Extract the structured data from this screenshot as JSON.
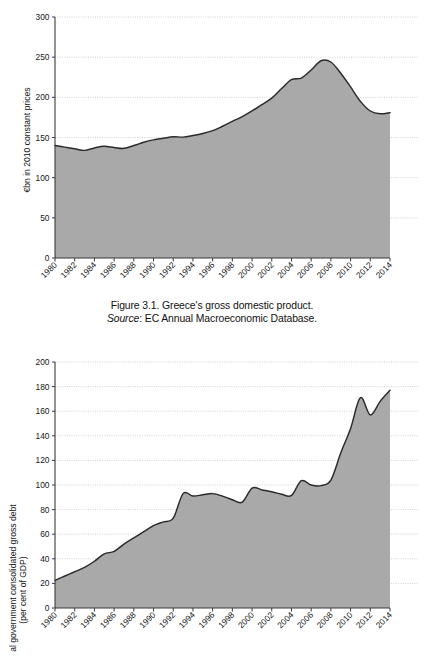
{
  "document": {
    "page_background": "#ffffff",
    "figures": [
      {
        "id": "figure-3-1",
        "caption_line_1": "Figure 3.1. Greece's gross domestic product.",
        "caption_source_label": "Source",
        "caption_source_text": ": EC Annual Macroeconomic Database."
      }
    ]
  },
  "chart_data": [
    {
      "id": "chart-gdp",
      "type": "area",
      "title": "",
      "xlabel": "",
      "ylabel": "€bn in 2010 constant prices",
      "ylim": [
        0,
        300
      ],
      "xlim": [
        1980,
        2014
      ],
      "grid": true,
      "legend": "none",
      "accent_fill": "#a9a9a9",
      "line_color": "#2a2a2a",
      "ytick_labels": [
        "0",
        "50",
        "100",
        "150",
        "200",
        "250",
        "300"
      ],
      "yticks": [
        0,
        50,
        100,
        150,
        200,
        250,
        300
      ],
      "xtick_labels": [
        "1980",
        "1982",
        "1984",
        "1986",
        "1988",
        "1990",
        "1992",
        "1994",
        "1996",
        "1998",
        "2000",
        "2002",
        "2004",
        "2006",
        "2008",
        "2010",
        "2012",
        "2014"
      ],
      "xticks": [
        1980,
        1982,
        1984,
        1986,
        1988,
        1990,
        1992,
        1994,
        1996,
        1998,
        2000,
        2002,
        2004,
        2006,
        2008,
        2010,
        2012,
        2014
      ],
      "x": [
        1980,
        1981,
        1982,
        1983,
        1984,
        1985,
        1986,
        1987,
        1988,
        1989,
        1990,
        1991,
        1992,
        1993,
        1994,
        1995,
        1996,
        1997,
        1998,
        1999,
        2000,
        2001,
        2002,
        2003,
        2004,
        2005,
        2006,
        2007,
        2008,
        2009,
        2010,
        2011,
        2012,
        2013,
        2014
      ],
      "values": [
        140,
        138,
        136,
        134,
        137,
        139,
        137.5,
        136.5,
        140,
        144,
        147,
        149,
        151,
        150.5,
        152.5,
        155,
        158.5,
        164,
        170,
        176,
        183,
        191,
        199,
        211,
        222,
        224,
        234,
        245.5,
        244,
        230,
        213,
        195,
        183,
        179.5,
        181
      ]
    },
    {
      "id": "chart-debt",
      "type": "area",
      "title": "",
      "xlabel": "",
      "ylabel_line_1": "General government consolidated gross debt",
      "ylabel_line_2": "(per cent of GDP)",
      "ylim": [
        0,
        200
      ],
      "xlim": [
        1980,
        2014
      ],
      "grid": true,
      "legend": "none",
      "accent_fill": "#a9a9a9",
      "line_color": "#2a2a2a",
      "ytick_labels": [
        "0",
        "20",
        "40",
        "60",
        "80",
        "100",
        "120",
        "140",
        "160",
        "180",
        "200"
      ],
      "yticks": [
        0,
        20,
        40,
        60,
        80,
        100,
        120,
        140,
        160,
        180,
        200
      ],
      "xtick_labels": [
        "1980",
        "1982",
        "1984",
        "1986",
        "1988",
        "1990",
        "1992",
        "1994",
        "1996",
        "1998",
        "2000",
        "2002",
        "2004",
        "2006",
        "2008",
        "2010",
        "2012",
        "2014"
      ],
      "xticks": [
        1980,
        1982,
        1984,
        1986,
        1988,
        1990,
        1992,
        1994,
        1996,
        1998,
        2000,
        2002,
        2004,
        2006,
        2008,
        2010,
        2012,
        2014
      ],
      "x": [
        1980,
        1981,
        1982,
        1983,
        1984,
        1985,
        1986,
        1987,
        1988,
        1989,
        1990,
        1991,
        1992,
        1993,
        1994,
        1995,
        1996,
        1997,
        1998,
        1999,
        2000,
        2001,
        2002,
        2003,
        2004,
        2005,
        2006,
        2007,
        2008,
        2009,
        2010,
        2011,
        2012,
        2013,
        2014
      ],
      "values": [
        22.5,
        26,
        29.5,
        33,
        38,
        44,
        46,
        52,
        57,
        62,
        67,
        70,
        73,
        93,
        91,
        92,
        93,
        91,
        88,
        86,
        97.5,
        96,
        94.5,
        92.5,
        91.5,
        103.5,
        100,
        99.5,
        104,
        126,
        146,
        171,
        157,
        168,
        177
      ]
    }
  ]
}
